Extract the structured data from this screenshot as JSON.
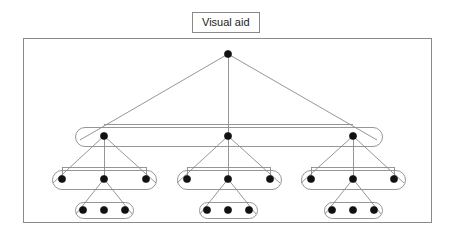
{
  "title": {
    "label": "Visual aid"
  },
  "figure": {
    "name": "hierarchical-tree-diagram",
    "width": 453,
    "height": 235,
    "frame": {
      "x": 23,
      "y": 38,
      "width": 408,
      "height": 184
    },
    "stroke_color": "#8a8a8a",
    "node_color": "#111111",
    "background": "#ffffff",
    "node_radius": 3.6,
    "levels": [
      {
        "name": "level-0-root",
        "depth": 0,
        "y": 54,
        "nodes": [
          {
            "id": "r",
            "x": 228,
            "y": 54
          }
        ]
      },
      {
        "name": "level-1-branch-roots",
        "depth": 1,
        "y": 136,
        "nodes": [
          {
            "id": "a",
            "x": 104,
            "y": 136
          },
          {
            "id": "b",
            "x": 228,
            "y": 136
          },
          {
            "id": "c",
            "x": 353,
            "y": 136
          }
        ]
      },
      {
        "name": "level-2-children",
        "depth": 2,
        "y": 179,
        "nodes": [
          {
            "id": "a1",
            "x": 62,
            "y": 179
          },
          {
            "id": "a2",
            "x": 104,
            "y": 179
          },
          {
            "id": "a3",
            "x": 146,
            "y": 179
          },
          {
            "id": "b1",
            "x": 187,
            "y": 179
          },
          {
            "id": "b2",
            "x": 228,
            "y": 179
          },
          {
            "id": "b3",
            "x": 270,
            "y": 179
          },
          {
            "id": "c1",
            "x": 311,
            "y": 179
          },
          {
            "id": "c2",
            "x": 353,
            "y": 179
          },
          {
            "id": "c3",
            "x": 394,
            "y": 179
          }
        ]
      },
      {
        "name": "level-3-leaves",
        "depth": 3,
        "y": 210,
        "nodes": [
          {
            "id": "a2a",
            "x": 83,
            "y": 210
          },
          {
            "id": "a2b",
            "x": 104,
            "y": 210
          },
          {
            "id": "a2c",
            "x": 125,
            "y": 210
          },
          {
            "id": "b2a",
            "x": 207,
            "y": 210
          },
          {
            "id": "b2b",
            "x": 228,
            "y": 210
          },
          {
            "id": "b2c",
            "x": 249,
            "y": 210
          },
          {
            "id": "c2a",
            "x": 332,
            "y": 210
          },
          {
            "id": "c2b",
            "x": 353,
            "y": 210
          },
          {
            "id": "c2c",
            "x": 374,
            "y": 210
          }
        ]
      }
    ],
    "connector_bars": [
      {
        "name": "root-bar",
        "y": 124,
        "x1": 104,
        "x2": 353
      },
      {
        "name": "branch-a-bar",
        "y": 167,
        "x1": 62,
        "x2": 146
      },
      {
        "name": "branch-b-bar",
        "y": 167,
        "x1": 187,
        "x2": 270
      },
      {
        "name": "branch-c-bar",
        "y": 167,
        "x1": 311,
        "x2": 394
      }
    ],
    "stems": [
      {
        "name": "root-stem",
        "x": 228,
        "y1": 54,
        "y2": 136
      },
      {
        "name": "branch-a-stem",
        "x": 104,
        "y1": 136,
        "y2": 179
      },
      {
        "name": "branch-b-stem",
        "x": 228,
        "y1": 136,
        "y2": 179
      },
      {
        "name": "branch-c-stem",
        "x": 353,
        "y1": 136,
        "y2": 179
      },
      {
        "name": "leaf-a-stem",
        "x": 62,
        "y1": 167,
        "y2": 179
      },
      {
        "name": "leaf-a3-stem",
        "x": 146,
        "y1": 167,
        "y2": 179
      },
      {
        "name": "leaf-b-stem",
        "x": 187,
        "y1": 167,
        "y2": 179
      },
      {
        "name": "leaf-b3-stem",
        "x": 270,
        "y1": 167,
        "y2": 179
      },
      {
        "name": "leaf-c-stem",
        "x": 311,
        "y1": 167,
        "y2": 179
      },
      {
        "name": "leaf-c3-stem",
        "x": 394,
        "y1": 167,
        "y2": 179
      }
    ],
    "triangles": [
      {
        "name": "root-triangle",
        "apex_x": 228,
        "apex_y": 54,
        "base_y": 140,
        "left_x": 80,
        "right_x": 377
      },
      {
        "name": "branch-a-triangle",
        "apex_x": 104,
        "apex_y": 136,
        "base_y": 183,
        "left_x": 53,
        "right_x": 156
      },
      {
        "name": "branch-b-triangle",
        "apex_x": 228,
        "apex_y": 136,
        "base_y": 183,
        "left_x": 177,
        "right_x": 280
      },
      {
        "name": "branch-c-triangle",
        "apex_x": 353,
        "apex_y": 136,
        "base_y": 183,
        "left_x": 301,
        "right_x": 404
      },
      {
        "name": "leaf-a-triangle",
        "apex_x": 104,
        "apex_y": 179,
        "base_y": 214,
        "left_x": 76,
        "right_x": 132
      },
      {
        "name": "leaf-b-triangle",
        "apex_x": 228,
        "apex_y": 179,
        "base_y": 214,
        "left_x": 200,
        "right_x": 256
      },
      {
        "name": "leaf-c-triangle",
        "apex_x": 353,
        "apex_y": 179,
        "base_y": 214,
        "left_x": 325,
        "right_x": 381
      }
    ],
    "capsules": [
      {
        "name": "level-1-capsule",
        "x": 75,
        "y": 127,
        "width": 307,
        "height": 19
      },
      {
        "name": "branch-a-capsule",
        "x": 52,
        "y": 170,
        "width": 104,
        "height": 19
      },
      {
        "name": "branch-b-capsule",
        "x": 177,
        "y": 170,
        "width": 104,
        "height": 19
      },
      {
        "name": "branch-c-capsule",
        "x": 301,
        "y": 170,
        "width": 104,
        "height": 19
      },
      {
        "name": "leaf-a-capsule",
        "x": 75,
        "y": 202,
        "width": 58,
        "height": 16
      },
      {
        "name": "leaf-b-capsule",
        "x": 199,
        "y": 202,
        "width": 58,
        "height": 16
      },
      {
        "name": "leaf-c-capsule",
        "x": 324,
        "y": 202,
        "width": 58,
        "height": 16
      }
    ]
  }
}
